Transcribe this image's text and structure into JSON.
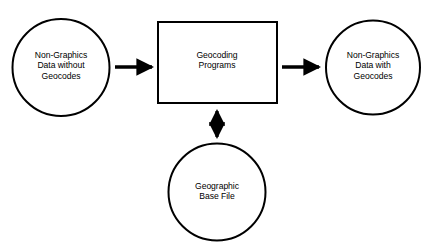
{
  "diagram": {
    "background_color": "#ffffff",
    "stroke_color": "#000000",
    "nodes": {
      "input_circle": {
        "shape": "circle",
        "text": "Non-Graphics\nData without\nGeocodes",
        "line1": "Non-Graphics",
        "line2": "Data without",
        "line3": "Geocodes"
      },
      "process_box": {
        "shape": "rectangle",
        "text": "Geocoding\nPrograms",
        "line1": "Geocoding",
        "line2": "Programs"
      },
      "output_circle": {
        "shape": "circle",
        "text": "Non-Graphics\nData with\nGeocodes",
        "line1": "Non-Graphics",
        "line2": "Data with",
        "line3": "Geocodes"
      },
      "base_file_circle": {
        "shape": "circle",
        "text": "Geographic\nBase File",
        "line1": "Geographic",
        "line2": "Base File"
      }
    },
    "connectors": [
      {
        "name": "input-to-process",
        "type": "arrow",
        "direction": "right"
      },
      {
        "name": "process-to-output",
        "type": "arrow",
        "direction": "right"
      },
      {
        "name": "process-to-base-file",
        "type": "arrow",
        "direction": "bidirectional-vertical"
      }
    ]
  }
}
